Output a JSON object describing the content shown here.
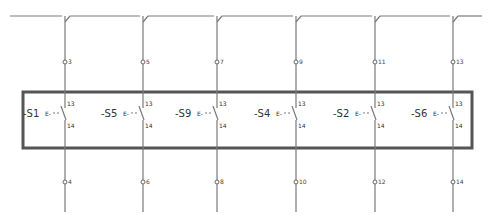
{
  "diagram": {
    "type": "electrical-schematic",
    "colors": {
      "wire": "#7a7a7a",
      "box": "#555555",
      "text": "#333333"
    },
    "columns": [
      {
        "x": 65,
        "device": "-S1",
        "prefix": "E-",
        "pin_top": "13",
        "pin_bottom": "14",
        "terminal_top": "3",
        "terminal_bottom": "4"
      },
      {
        "x": 143,
        "device": "-S5",
        "prefix": "E-",
        "pin_top": "13",
        "pin_bottom": "14",
        "terminal_top": "5",
        "terminal_bottom": "6"
      },
      {
        "x": 217,
        "device": "-S9",
        "prefix": "E-",
        "pin_top": "13",
        "pin_bottom": "14",
        "terminal_top": "7",
        "terminal_bottom": "8"
      },
      {
        "x": 296,
        "device": "-S4",
        "prefix": "E-",
        "pin_top": "13",
        "pin_bottom": "14",
        "terminal_top": "9",
        "terminal_bottom": "10"
      },
      {
        "x": 375,
        "device": "-S2",
        "prefix": "E-",
        "pin_top": "13",
        "pin_bottom": "14",
        "terminal_top": "11",
        "terminal_bottom": "12"
      },
      {
        "x": 453,
        "device": "-S6",
        "prefix": "E-",
        "pin_top": "13",
        "pin_bottom": "14",
        "terminal_top": "13",
        "terminal_bottom": "14"
      }
    ]
  }
}
